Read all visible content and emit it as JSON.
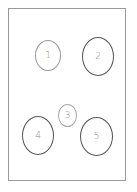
{
  "diagram": {
    "frame": {
      "border_color": "#9a9a9a"
    },
    "nodes": [
      {
        "id": "1",
        "label": "1",
        "stroke": "#9a9a9a"
      },
      {
        "id": "2",
        "label": "2",
        "stroke": "#555555"
      },
      {
        "id": "3",
        "label": "3",
        "stroke": "#a8a8a8"
      },
      {
        "id": "4",
        "label": "4",
        "stroke": "#555555"
      },
      {
        "id": "5",
        "label": "5",
        "stroke": "#555555"
      }
    ]
  }
}
